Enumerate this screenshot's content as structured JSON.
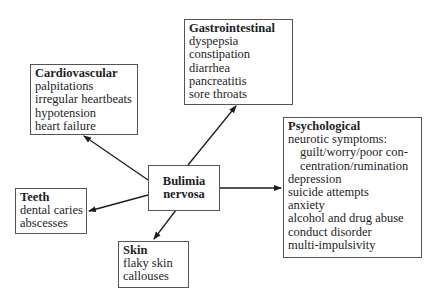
{
  "center": {
    "line1": "Bulimia",
    "line2": "nervosa"
  },
  "categories": {
    "gastrointestinal": {
      "title": "Gastrointestinal",
      "items": [
        "dyspepsia",
        "constipation",
        "diarrhea",
        "pancreatitis",
        "sore throats"
      ]
    },
    "cardiovascular": {
      "title": "Cardiovascular",
      "items": [
        "palpitations",
        "irregular heartbeats",
        "hypotension",
        "heart failure"
      ]
    },
    "psychological": {
      "title": "Psychological",
      "items": [
        "neurotic symptoms:",
        "guilt/worry/poor con-",
        "centration/rumination",
        "depression",
        "suicide attempts",
        "anxiety",
        "alcohol and drug abuse",
        "conduct disorder",
        "multi-impulsivity"
      ]
    },
    "teeth": {
      "title": "Teeth",
      "items": [
        "dental caries",
        "abscesses"
      ]
    },
    "skin": {
      "title": "Skin",
      "items": [
        "flaky skin",
        "callouses"
      ]
    }
  },
  "colors": {
    "border": "#555555",
    "arrow": "#1e1e1e",
    "text": "#1e1e1e"
  }
}
